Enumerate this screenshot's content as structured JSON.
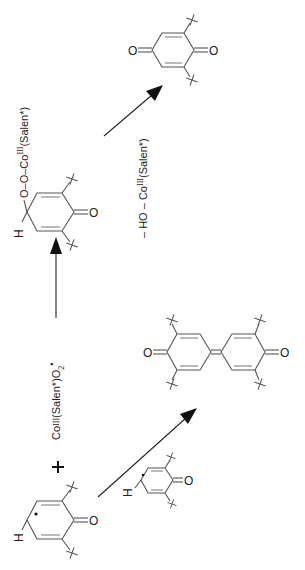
{
  "diagram": {
    "title": "",
    "type": "reaction-scheme",
    "orientation": "rotated-90-ccw",
    "colors": {
      "ink": "#222222",
      "bond": "#555555",
      "background": "#ffffff"
    },
    "species": {
      "radical_start": {
        "name": "phenoxyl radical (2,6-di-tert-butyl)",
        "H": "H",
        "O": "O",
        "radical_dot": "•"
      },
      "plus": "+",
      "reagent": {
        "prefix": "Co",
        "oxidation": "III",
        "ligand": "(Salen*)O",
        "sub": "2",
        "radical": "•"
      },
      "peroxo_intermediate": {
        "H": "H",
        "O_ring": "O",
        "chain": "O–O–Co",
        "oxidation": "III",
        "ligand": "(Salen*)"
      },
      "elimination": {
        "prefix": "– HO – Co",
        "oxidation": "III",
        "ligand": "(Salen*)"
      },
      "quinone": {
        "O_left": "O",
        "O_right": "O"
      },
      "radical_second": {
        "H": "H",
        "O": "O"
      },
      "diphenoquinone": {
        "O_left": "O",
        "O_right": "O"
      }
    },
    "arrows": [
      {
        "id": "to-peroxo",
        "direction": "up"
      },
      {
        "id": "to-quinone",
        "direction": "up-right"
      },
      {
        "id": "to-diphenoquinone",
        "direction": "up-right"
      }
    ]
  }
}
